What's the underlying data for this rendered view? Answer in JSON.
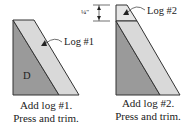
{
  "colors": {
    "dark_fabric": "#9a9a9a",
    "light_fabric": "#d9d9d9",
    "top_block": "#e6e6e6",
    "outline": "#333333"
  },
  "steps": [
    {
      "piece_label": "D",
      "callout": "Log #1",
      "caption_line1": "Add log #1.",
      "caption_line2": "Press and trim."
    },
    {
      "callout": "Log #2",
      "measurement": "¼\"",
      "caption_line1": "Add log #2.",
      "caption_line2": "Press and trim."
    }
  ]
}
